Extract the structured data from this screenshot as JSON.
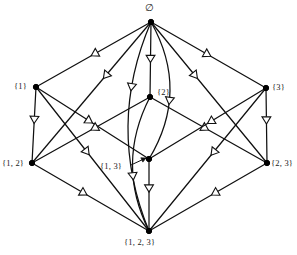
{
  "diagram": {
    "width": 297,
    "height": 255,
    "background_color": "#ffffff",
    "line_color": "#101010",
    "node_color": "#000000",
    "arrowhead_fill": "#ffffff",
    "arrowhead_style": "hollow-triangle",
    "arrow_direction": "downward"
  },
  "nodes": [
    {
      "id": "empty",
      "label": "∅",
      "x": 151,
      "y": 22,
      "label_x": 145,
      "label_y": 4,
      "level": 0
    },
    {
      "id": "s1",
      "label": "{1}",
      "x": 36,
      "y": 87,
      "label_x": 14,
      "label_y": 82,
      "level": 1
    },
    {
      "id": "s2",
      "label": "{2}",
      "x": 150,
      "y": 97,
      "label_x": 157,
      "label_y": 88,
      "level": 1
    },
    {
      "id": "s3",
      "label": "{3}",
      "x": 266,
      "y": 88,
      "label_x": 272,
      "label_y": 83,
      "level": 1
    },
    {
      "id": "s12",
      "label": "{1, 2}",
      "x": 32,
      "y": 163,
      "label_x": 2,
      "label_y": 159,
      "level": 2
    },
    {
      "id": "s13",
      "label": "{1, 3}",
      "x": 149,
      "y": 159,
      "label_x": 100,
      "label_y": 162,
      "level": 2
    },
    {
      "id": "s23",
      "label": "{2, 3}",
      "x": 267,
      "y": 163,
      "label_x": 271,
      "label_y": 159,
      "level": 2
    },
    {
      "id": "s123",
      "label": "{1, 2, 3}",
      "x": 149,
      "y": 231,
      "label_x": 124,
      "label_y": 238,
      "level": 3
    }
  ],
  "edges": [
    {
      "id": "e-empty-s1",
      "from": "empty",
      "to": "s1",
      "shape": "straight",
      "arrow_t": 0.52
    },
    {
      "id": "e-empty-s2",
      "from": "empty",
      "to": "s2",
      "shape": "straight",
      "arrow_t": 0.54
    },
    {
      "id": "e-empty-s3",
      "from": "empty",
      "to": "s3",
      "shape": "straight",
      "arrow_t": 0.52
    },
    {
      "id": "e-empty-s12",
      "from": "empty",
      "to": "s12",
      "shape": "straight",
      "arrow_t": 0.4
    },
    {
      "id": "e-empty-s13",
      "from": "empty",
      "to": "s13",
      "shape": "curve-left",
      "curve": -20,
      "arrow_t": 0.6
    },
    {
      "id": "e-empty-s23",
      "from": "empty",
      "to": "s23",
      "shape": "straight",
      "arrow_t": 0.4
    },
    {
      "id": "e-empty-s123",
      "from": "empty",
      "to": "s123",
      "shape": "curve-right",
      "curve": 22,
      "arrow_t": 0.33
    },
    {
      "id": "e-s1-s12",
      "from": "s1",
      "to": "s12",
      "shape": "straight",
      "arrow_t": 0.48
    },
    {
      "id": "e-s1-s13",
      "from": "s1",
      "to": "s13",
      "shape": "straight",
      "arrow_t": 0.5
    },
    {
      "id": "e-s1-s123",
      "from": "s1",
      "to": "s123",
      "shape": "straight",
      "arrow_t": 0.47
    },
    {
      "id": "e-s2-s12",
      "from": "s2",
      "to": "s12",
      "shape": "straight",
      "arrow_t": 0.5
    },
    {
      "id": "e-s2-s23",
      "from": "s2",
      "to": "s23",
      "shape": "straight",
      "arrow_t": 0.5
    },
    {
      "id": "e-s2-s123",
      "from": "s2",
      "to": "s123",
      "shape": "curve-right",
      "curve": 17,
      "arrow_t": 0.62
    },
    {
      "id": "e-s3-s13",
      "from": "s3",
      "to": "s13",
      "shape": "straight",
      "arrow_t": 0.5
    },
    {
      "id": "e-s3-s23",
      "from": "s3",
      "to": "s23",
      "shape": "straight",
      "arrow_t": 0.48
    },
    {
      "id": "e-s3-s123",
      "from": "s3",
      "to": "s123",
      "shape": "straight",
      "arrow_t": 0.47
    },
    {
      "id": "e-s12-s123",
      "from": "s12",
      "to": "s123",
      "shape": "straight",
      "arrow_t": 0.47
    },
    {
      "id": "e-s13-s123",
      "from": "s13",
      "to": "s123",
      "shape": "straight",
      "arrow_t": 0.46
    },
    {
      "id": "e-s23-s123",
      "from": "s23",
      "to": "s123",
      "shape": "straight",
      "arrow_t": 0.47
    }
  ],
  "leader": {
    "id": "leader-s13",
    "from_x": 131,
    "from_y": 165,
    "to_x": 146,
    "to_y": 158
  }
}
